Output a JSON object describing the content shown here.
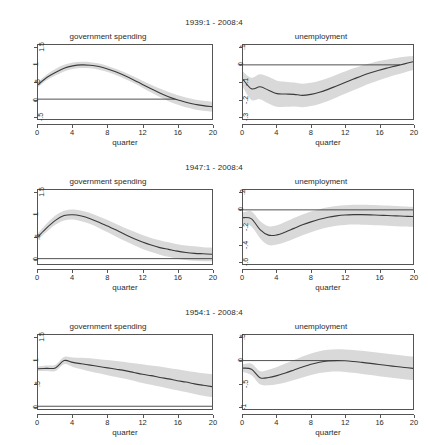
{
  "figure": {
    "xlabel": "quarter",
    "left_panel_title": "government spending",
    "right_panel_title": "unemployment",
    "band_color": "#d9d9d9",
    "line_color": "#3a3a3a"
  },
  "rows": [
    {
      "title": "1939:1 - 2008:4",
      "left": {
        "yticks": [
          "-.5",
          "0",
          ".5",
          "1",
          "1.5"
        ],
        "xticks": [
          "0",
          "4",
          "8",
          "12",
          "16",
          "20"
        ]
      },
      "right": {
        "yticks": [
          "-.3",
          "-.2",
          "-.1",
          "0",
          ".1"
        ],
        "xticks": [
          "0",
          "4",
          "8",
          "12",
          "16",
          "20"
        ]
      }
    },
    {
      "title": "1947:1 - 2008:4",
      "left": {
        "yticks": [
          "0",
          ".5",
          "1",
          "1.5"
        ],
        "xticks": [
          "0",
          "4",
          "8",
          "12",
          "16",
          "20"
        ]
      },
      "right": {
        "yticks": [
          "-.6",
          "-.4",
          "-.2",
          "0",
          ".2"
        ],
        "xticks": [
          "0",
          "4",
          "8",
          "12",
          "16",
          "20"
        ]
      }
    },
    {
      "title": "1954:1 - 2008:4",
      "left": {
        "yticks": [
          "0",
          ".5",
          "1",
          "1.5"
        ],
        "xticks": [
          "0",
          "4",
          "8",
          "12",
          "16",
          "20"
        ]
      },
      "right": {
        "yticks": [
          "-1",
          "-.5",
          "0",
          ".5"
        ],
        "xticks": [
          "0",
          "4",
          "8",
          "12",
          "16",
          "20"
        ]
      }
    }
  ],
  "chart_data": [
    {
      "type": "line",
      "title": "government spending",
      "subtitle": "1939:1 - 2008:4",
      "xlabel": "quarter",
      "ylabel": "",
      "xlim": [
        0,
        20
      ],
      "ylim": [
        -0.5,
        1.5
      ],
      "grid": false,
      "legend": "none",
      "x": [
        0,
        1,
        2,
        3,
        4,
        5,
        6,
        7,
        8,
        9,
        10,
        11,
        12,
        13,
        14,
        15,
        16,
        17,
        18,
        19,
        20
      ],
      "series": [
        {
          "name": "mean response",
          "values": [
            0.42,
            0.63,
            0.78,
            0.9,
            0.97,
            1.0,
            0.99,
            0.95,
            0.88,
            0.79,
            0.68,
            0.56,
            0.43,
            0.3,
            0.18,
            0.07,
            -0.02,
            -0.09,
            -0.15,
            -0.19,
            -0.22
          ]
        },
        {
          "name": "upper band",
          "values": [
            0.5,
            0.72,
            0.88,
            1.0,
            1.07,
            1.09,
            1.08,
            1.04,
            0.97,
            0.88,
            0.78,
            0.66,
            0.54,
            0.42,
            0.31,
            0.21,
            0.12,
            0.05,
            -0.01,
            -0.05,
            -0.08
          ]
        },
        {
          "name": "lower band",
          "values": [
            0.35,
            0.55,
            0.69,
            0.81,
            0.88,
            0.91,
            0.9,
            0.86,
            0.79,
            0.7,
            0.59,
            0.47,
            0.33,
            0.19,
            0.06,
            -0.06,
            -0.16,
            -0.24,
            -0.3,
            -0.34,
            -0.37
          ]
        }
      ]
    },
    {
      "type": "line",
      "title": "unemployment",
      "subtitle": "1939:1 - 2008:4",
      "xlabel": "quarter",
      "ylabel": "",
      "xlim": [
        0,
        20
      ],
      "ylim": [
        -0.3,
        0.1
      ],
      "grid": false,
      "legend": "none",
      "x": [
        0,
        1,
        2,
        3,
        4,
        5,
        6,
        7,
        8,
        9,
        10,
        11,
        12,
        13,
        14,
        15,
        16,
        17,
        18,
        19,
        20
      ],
      "series": [
        {
          "name": "mean response",
          "values": [
            -0.085,
            -0.14,
            -0.128,
            -0.148,
            -0.168,
            -0.17,
            -0.172,
            -0.178,
            -0.172,
            -0.16,
            -0.143,
            -0.123,
            -0.103,
            -0.083,
            -0.063,
            -0.046,
            -0.031,
            -0.018,
            -0.006,
            0.006,
            0.018
          ]
        },
        {
          "name": "upper band",
          "values": [
            -0.04,
            -0.075,
            -0.055,
            -0.07,
            -0.092,
            -0.098,
            -0.103,
            -0.11,
            -0.105,
            -0.093,
            -0.076,
            -0.057,
            -0.038,
            -0.02,
            -0.003,
            0.01,
            0.022,
            0.032,
            0.04,
            0.047,
            0.052
          ]
        },
        {
          "name": "lower band",
          "values": [
            -0.132,
            -0.205,
            -0.2,
            -0.225,
            -0.245,
            -0.245,
            -0.243,
            -0.247,
            -0.24,
            -0.228,
            -0.211,
            -0.19,
            -0.169,
            -0.148,
            -0.127,
            -0.108,
            -0.09,
            -0.074,
            -0.058,
            -0.044,
            -0.03
          ]
        }
      ]
    },
    {
      "type": "line",
      "title": "government spending",
      "subtitle": "1947:1 - 2008:4",
      "xlabel": "quarter",
      "ylabel": "",
      "xlim": [
        0,
        20
      ],
      "ylim": [
        -0.25,
        1.5
      ],
      "grid": false,
      "legend": "none",
      "x": [
        0,
        1,
        2,
        3,
        4,
        5,
        6,
        7,
        8,
        9,
        10,
        11,
        12,
        13,
        14,
        15,
        16,
        17,
        18,
        19,
        20
      ],
      "series": [
        {
          "name": "mean response",
          "values": [
            0.5,
            0.7,
            0.87,
            0.98,
            1.0,
            0.97,
            0.91,
            0.83,
            0.74,
            0.65,
            0.55,
            0.46,
            0.38,
            0.31,
            0.25,
            0.21,
            0.17,
            0.14,
            0.12,
            0.11,
            0.1
          ]
        },
        {
          "name": "upper band",
          "values": [
            0.58,
            0.8,
            0.98,
            1.09,
            1.12,
            1.09,
            1.04,
            0.96,
            0.88,
            0.79,
            0.7,
            0.62,
            0.54,
            0.47,
            0.42,
            0.37,
            0.33,
            0.3,
            0.28,
            0.26,
            0.25
          ]
        },
        {
          "name": "lower band",
          "values": [
            0.43,
            0.61,
            0.77,
            0.87,
            0.89,
            0.85,
            0.79,
            0.7,
            0.6,
            0.5,
            0.4,
            0.31,
            0.22,
            0.15,
            0.09,
            0.04,
            0.0,
            -0.03,
            -0.05,
            -0.06,
            -0.06
          ]
        }
      ]
    },
    {
      "type": "line",
      "title": "unemployment",
      "subtitle": "1947:1 - 2008:4",
      "xlabel": "quarter",
      "ylabel": "",
      "xlim": [
        -0.68,
        0.2
      ],
      "ylim": [
        -0.68,
        0.2
      ],
      "grid": false,
      "legend": "none",
      "x": [
        0,
        1,
        2,
        3,
        4,
        5,
        6,
        7,
        8,
        9,
        10,
        11,
        12,
        13,
        14,
        15,
        16,
        17,
        18,
        19,
        20
      ],
      "series": [
        {
          "name": "mean response",
          "values": [
            -0.09,
            -0.105,
            -0.23,
            -0.295,
            -0.292,
            -0.258,
            -0.216,
            -0.175,
            -0.14,
            -0.11,
            -0.086,
            -0.07,
            -0.06,
            -0.056,
            -0.056,
            -0.058,
            -0.062,
            -0.066,
            -0.07,
            -0.074,
            -0.078
          ]
        },
        {
          "name": "upper band",
          "values": [
            -0.03,
            -0.02,
            -0.13,
            -0.19,
            -0.18,
            -0.14,
            -0.095,
            -0.055,
            -0.02,
            0.008,
            0.03,
            0.045,
            0.055,
            0.06,
            0.06,
            0.058,
            0.055,
            0.05,
            0.045,
            0.04,
            0.036
          ]
        },
        {
          "name": "lower band",
          "values": [
            -0.15,
            -0.195,
            -0.33,
            -0.41,
            -0.405,
            -0.375,
            -0.337,
            -0.296,
            -0.26,
            -0.228,
            -0.203,
            -0.186,
            -0.176,
            -0.172,
            -0.173,
            -0.176,
            -0.18,
            -0.185,
            -0.19,
            -0.194,
            -0.198
          ]
        }
      ]
    },
    {
      "type": "line",
      "title": "government spending",
      "subtitle": "1954:1 - 2008:4",
      "xlabel": "quarter",
      "ylabel": "",
      "xlim": [
        0,
        20
      ],
      "ylim": [
        0,
        1.5
      ],
      "grid": false,
      "legend": "none",
      "x": [
        0,
        1,
        2,
        3,
        4,
        5,
        6,
        7,
        8,
        9,
        10,
        11,
        12,
        13,
        14,
        15,
        16,
        17,
        18,
        19,
        20
      ],
      "series": [
        {
          "name": "mean response",
          "values": [
            0.82,
            0.83,
            0.84,
            1.0,
            0.96,
            0.93,
            0.9,
            0.87,
            0.84,
            0.81,
            0.78,
            0.74,
            0.7,
            0.67,
            0.63,
            0.6,
            0.56,
            0.53,
            0.49,
            0.46,
            0.43
          ]
        },
        {
          "name": "upper band",
          "values": [
            0.87,
            0.89,
            0.91,
            1.08,
            1.07,
            1.06,
            1.05,
            1.03,
            1.01,
            0.99,
            0.97,
            0.94,
            0.92,
            0.89,
            0.87,
            0.84,
            0.81,
            0.78,
            0.75,
            0.72,
            0.7
          ]
        },
        {
          "name": "lower band",
          "values": [
            0.77,
            0.77,
            0.77,
            0.92,
            0.86,
            0.81,
            0.76,
            0.72,
            0.68,
            0.64,
            0.6,
            0.56,
            0.51,
            0.47,
            0.43,
            0.39,
            0.35,
            0.31,
            0.27,
            0.23,
            0.2
          ]
        }
      ]
    },
    {
      "type": "line",
      "title": "unemployment",
      "subtitle": "1954:1 - 2008:4",
      "xlabel": "quarter",
      "ylabel": "",
      "xlim": [
        0,
        20
      ],
      "ylim": [
        -1.0,
        0.5
      ],
      "grid": false,
      "legend": "none",
      "x": [
        0,
        1,
        2,
        3,
        4,
        5,
        6,
        7,
        8,
        9,
        10,
        11,
        12,
        13,
        14,
        15,
        16,
        17,
        18,
        19,
        20
      ],
      "series": [
        {
          "name": "mean response",
          "values": [
            -0.165,
            -0.19,
            -0.375,
            -0.37,
            -0.33,
            -0.27,
            -0.205,
            -0.14,
            -0.08,
            -0.035,
            -0.008,
            0.0,
            -0.005,
            -0.02,
            -0.04,
            -0.062,
            -0.085,
            -0.108,
            -0.13,
            -0.15,
            -0.17
          ]
        },
        {
          "name": "upper band",
          "values": [
            -0.08,
            -0.07,
            -0.23,
            -0.2,
            -0.14,
            -0.065,
            0.015,
            0.09,
            0.155,
            0.205,
            0.235,
            0.248,
            0.245,
            0.232,
            0.213,
            0.192,
            0.17,
            0.148,
            0.126,
            0.106,
            0.088
          ]
        },
        {
          "name": "lower band",
          "values": [
            -0.25,
            -0.32,
            -0.52,
            -0.54,
            -0.52,
            -0.478,
            -0.425,
            -0.37,
            -0.315,
            -0.272,
            -0.248,
            -0.24,
            -0.248,
            -0.268,
            -0.293,
            -0.318,
            -0.342,
            -0.365,
            -0.387,
            -0.407,
            -0.427
          ]
        }
      ]
    }
  ]
}
